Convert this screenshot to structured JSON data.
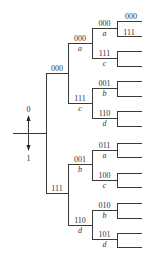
{
  "diagram": {
    "type": "code-tree",
    "input_axis": {
      "up_label": "0",
      "down_label": "1"
    },
    "root_branches": [
      {
        "code": "000",
        "symbol": "",
        "children": [
          {
            "code": "000",
            "symbol": "a",
            "children": [
              {
                "code": "000",
                "symbol": "a",
                "leaf_labels": [
                  "000",
                  "111"
                ]
              },
              {
                "code": "111",
                "symbol": "c"
              }
            ]
          },
          {
            "code": "111",
            "symbol": "c",
            "children": [
              {
                "code": "001",
                "symbol": "b"
              },
              {
                "code": "110",
                "symbol": "d"
              }
            ]
          }
        ]
      },
      {
        "code": "111",
        "symbol": "",
        "children": [
          {
            "code": "001",
            "symbol": "b",
            "children": [
              {
                "code": "011",
                "symbol": "a"
              },
              {
                "code": "100",
                "symbol": "c"
              }
            ]
          },
          {
            "code": "110",
            "symbol": "d",
            "children": [
              {
                "code": "010",
                "symbol": "b"
              },
              {
                "code": "101",
                "symbol": "d"
              }
            ]
          }
        ]
      }
    ]
  }
}
